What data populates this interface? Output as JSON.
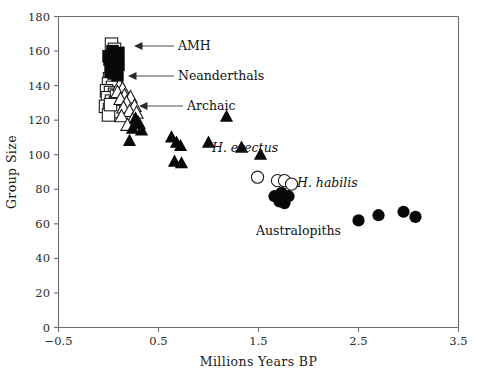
{
  "chart_data": {
    "type": "scatter",
    "title": "",
    "xlabel": "Millions Years BP",
    "ylabel": "Group Size",
    "xlim": [
      -0.5,
      3.5
    ],
    "ylim": [
      0,
      180
    ],
    "xticks": [
      "-0.5",
      "0.5",
      "1.5",
      "2.5",
      "3.5"
    ],
    "xtick_values": [
      -0.5,
      0.5,
      1.5,
      2.5,
      3.5
    ],
    "yticks": [
      "0",
      "20",
      "40",
      "60",
      "80",
      "100",
      "120",
      "140",
      "160",
      "180"
    ],
    "ytick_values": [
      0,
      20,
      40,
      60,
      80,
      100,
      120,
      140,
      160,
      180
    ],
    "grid": false,
    "legend": "none (in-plot annotations with arrows)",
    "series": [
      {
        "name": "AMH",
        "marker": "filled-square",
        "points": [
          [
            0.04,
            160
          ],
          [
            0.1,
            159
          ],
          [
            0.01,
            155
          ],
          [
            0.06,
            154
          ],
          [
            0.1,
            152
          ],
          [
            0.03,
            151
          ],
          [
            0.07,
            158
          ],
          [
            0.0,
            157
          ],
          [
            0.05,
            147
          ],
          [
            0.09,
            146
          ],
          [
            0.02,
            148
          ]
        ]
      },
      {
        "name": "Neanderthals",
        "marker": "open-square",
        "points": [
          [
            0.03,
            164
          ],
          [
            0.06,
            161
          ],
          [
            0.01,
            144
          ],
          [
            0.05,
            143
          ],
          [
            0.0,
            141
          ],
          [
            0.04,
            139
          ],
          [
            -0.02,
            137
          ],
          [
            0.02,
            136
          ],
          [
            0.06,
            135
          ],
          [
            -0.01,
            133
          ],
          [
            0.03,
            131
          ],
          [
            0.07,
            130
          ],
          [
            -0.03,
            128
          ],
          [
            0.01,
            126
          ],
          [
            0.05,
            125
          ],
          [
            0.0,
            123
          ],
          [
            0.08,
            134
          ],
          [
            0.02,
            129
          ]
        ]
      },
      {
        "name": "Archaic",
        "marker": "open-triangle",
        "points": [
          [
            0.11,
            140
          ],
          [
            0.14,
            138
          ],
          [
            0.09,
            136
          ],
          [
            0.16,
            134
          ],
          [
            0.12,
            132
          ],
          [
            0.22,
            133
          ],
          [
            0.18,
            130
          ],
          [
            0.26,
            128
          ],
          [
            0.15,
            127
          ],
          [
            0.21,
            125
          ],
          [
            0.28,
            124
          ],
          [
            0.13,
            122
          ],
          [
            0.24,
            120
          ],
          [
            0.3,
            118
          ],
          [
            0.19,
            117
          ]
        ]
      },
      {
        "name": "H. erectus",
        "marker": "filled-triangle",
        "points": [
          [
            0.27,
            121
          ],
          [
            0.3,
            118
          ],
          [
            0.24,
            115
          ],
          [
            0.33,
            114
          ],
          [
            0.21,
            108
          ],
          [
            0.63,
            110
          ],
          [
            0.68,
            107
          ],
          [
            0.72,
            105
          ],
          [
            0.66,
            96
          ],
          [
            0.73,
            95
          ],
          [
            1.0,
            107
          ],
          [
            1.18,
            122
          ],
          [
            1.33,
            104
          ],
          [
            1.52,
            100
          ]
        ]
      },
      {
        "name": "H. habilis",
        "marker": "open-circle",
        "points": [
          [
            1.49,
            87
          ],
          [
            1.69,
            85
          ],
          [
            1.76,
            85
          ],
          [
            1.83,
            83
          ]
        ]
      },
      {
        "name": "Australopiths",
        "marker": "filled-circle",
        "points": [
          [
            1.66,
            76
          ],
          [
            1.73,
            78
          ],
          [
            1.8,
            76
          ],
          [
            1.76,
            72
          ],
          [
            1.71,
            73
          ],
          [
            2.5,
            62
          ],
          [
            2.7,
            65
          ],
          [
            2.95,
            67
          ],
          [
            3.07,
            64
          ]
        ]
      }
    ],
    "annotations": [
      {
        "text": "AMH",
        "style": "upright",
        "target": [
          0.18,
          158
        ]
      },
      {
        "text": "Neanderthals",
        "style": "upright",
        "target": [
          0.16,
          146
        ]
      },
      {
        "text": "Archaic",
        "style": "upright",
        "target": [
          0.35,
          129
        ]
      },
      {
        "text": "H. erectus",
        "style": "italic",
        "target": null
      },
      {
        "text": "H. habilis",
        "style": "italic",
        "target": null
      },
      {
        "text": "Australopiths",
        "style": "upright",
        "target": null
      }
    ]
  }
}
